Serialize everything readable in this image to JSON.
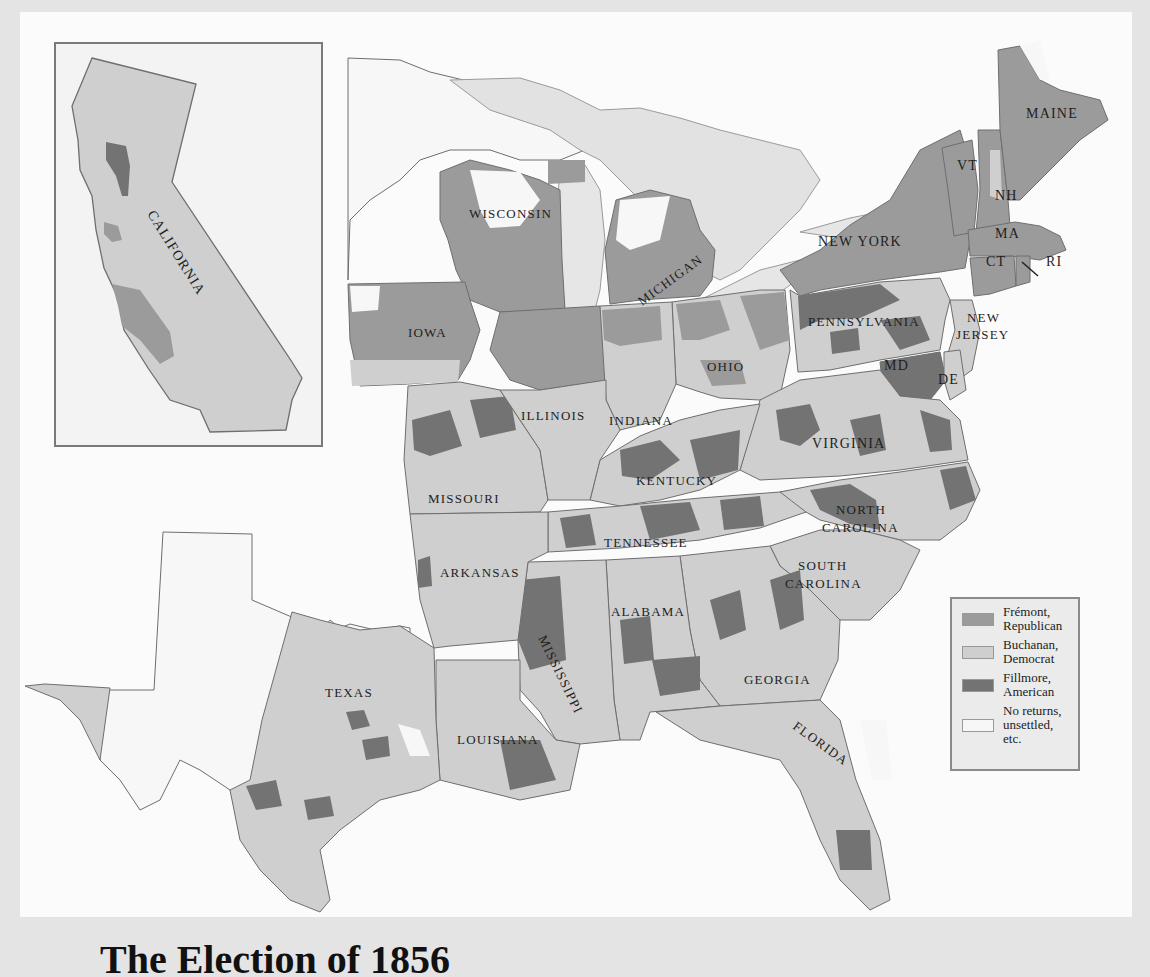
{
  "map": {
    "title": "1856 Presidential Election by County",
    "colors": {
      "fremont": "#9b9b9b",
      "buchanan": "#cfcfcf",
      "fillmore": "#737373",
      "none": "#f7f7f7",
      "border": "#6e6e6e",
      "water": "#dcdcdc",
      "background": "#fbfbfb"
    },
    "inset": {
      "label": "CALIFORNIA"
    },
    "states": [
      "MAINE",
      "VT",
      "NH",
      "MA",
      "CT",
      "RI",
      "NEW YORK",
      "NEW JERSEY",
      "PENNSYLVANIA",
      "MD",
      "DE",
      "VIRGINIA",
      "NORTH CAROLINA",
      "SOUTH CAROLINA",
      "GEORGIA",
      "FLORIDA",
      "ALABAMA",
      "MISSISSIPPI",
      "LOUISIANA",
      "TEXAS",
      "ARKANSAS",
      "TENNESSEE",
      "KENTUCKY",
      "OHIO",
      "INDIANA",
      "ILLINOIS",
      "MISSOURI",
      "IOWA",
      "WISCONSIN",
      "MICHIGAN"
    ],
    "labels": {
      "california": "CALIFORNIA",
      "maine": "MAINE",
      "vt": "VT",
      "nh": "NH",
      "ma": "MA",
      "ct": "CT",
      "ri": "RI",
      "new_york": "NEW YORK",
      "new_jersey_1": "NEW",
      "new_jersey_2": "JERSEY",
      "pennsylvania": "PENNSYLVANIA",
      "md": "MD",
      "de": "DE",
      "virginia": "VIRGINIA",
      "north_carolina_1": "NORTH",
      "north_carolina_2": "CAROLINA",
      "south_carolina_1": "SOUTH",
      "south_carolina_2": "CAROLINA",
      "georgia": "GEORGIA",
      "florida": "FLORIDA",
      "alabama": "ALABAMA",
      "mississippi": "MISSISSIPPI",
      "louisiana": "LOUISIANA",
      "texas": "TEXAS",
      "arkansas": "ARKANSAS",
      "tennessee": "TENNESSEE",
      "kentucky": "KENTUCKY",
      "ohio": "OHIO",
      "indiana": "INDIANA",
      "illinois": "ILLINOIS",
      "missouri": "MISSOURI",
      "iowa": "IOWA",
      "wisconsin": "WISCONSIN",
      "michigan": "MICHIGAN"
    }
  },
  "legend": {
    "items": [
      {
        "line1": "Frémont,",
        "line2": "Republican",
        "key": "fremont"
      },
      {
        "line1": "Buchanan,",
        "line2": "Democrat",
        "key": "buchanan"
      },
      {
        "line1": "Fillmore,",
        "line2": "American",
        "key": "fillmore"
      },
      {
        "line1": "No returns,",
        "line2": "unsettled, etc.",
        "key": "none"
      }
    ]
  },
  "caption": {
    "text": "The Election of 1856"
  }
}
